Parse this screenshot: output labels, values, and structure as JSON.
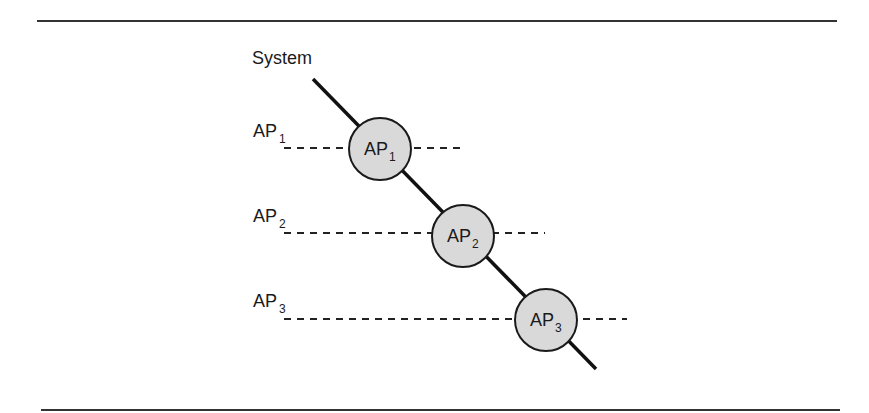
{
  "diagram": {
    "system_label": "System",
    "colors": {
      "line": "#111111",
      "node_fill": "#d9d9d9",
      "node_stroke": "#1a1a1a",
      "rule": "#333333"
    },
    "access_points": [
      {
        "label_main": "AP",
        "label_sub": "1",
        "node_main": "AP",
        "node_sub": "1"
      },
      {
        "label_main": "AP",
        "label_sub": "2",
        "node_main": "AP",
        "node_sub": "2"
      },
      {
        "label_main": "AP",
        "label_sub": "3",
        "node_main": "AP",
        "node_sub": "3"
      }
    ]
  }
}
